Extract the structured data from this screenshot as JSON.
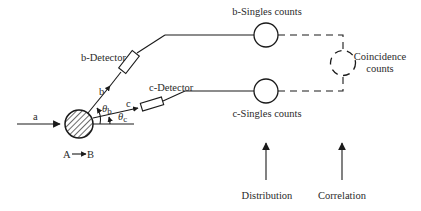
{
  "diagram": {
    "type": "experimental-setup-schematic",
    "labels": {
      "beam": "a",
      "reaction": {
        "from": "A",
        "to": "B"
      },
      "b_particle": "b",
      "c_particle": "c",
      "theta_b": "θ",
      "theta_b_sub": "b",
      "theta_c": "θ",
      "theta_c_sub": "c",
      "b_detector": "b-Detector",
      "c_detector": "c-Detector",
      "b_singles": "b-Singles counts",
      "c_singles": "c-Singles counts",
      "coincidence_line1": "Coincidence",
      "coincidence_line2": "counts",
      "distribution": "Distribution",
      "correlation": "Correlation"
    },
    "colors": {
      "stroke": "#1a1a1a",
      "text": "#2a2a2a",
      "background": "#ffffff"
    }
  }
}
